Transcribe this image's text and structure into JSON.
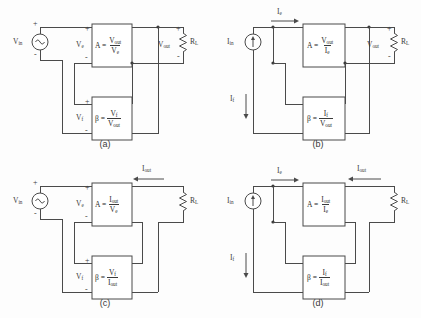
{
  "figure": {
    "background_color": "#fdfdfd",
    "line_color": "#4a4a4a"
  },
  "panels": [
    {
      "id": "a",
      "caption": "(a)",
      "topology": "series-shunt (voltage-series) voltage amplifier",
      "source": {
        "label": "V",
        "sub": "in",
        "type": "ac-voltage-source",
        "plus": "+",
        "minus": "-"
      },
      "error_signal": {
        "label": "V",
        "sub": "e",
        "plus": "+",
        "minus": "-"
      },
      "amplifier": {
        "symbol": "A",
        "equals": "=",
        "numerator": "V",
        "numerator_sub": "out",
        "denominator": "V",
        "denominator_sub": "e"
      },
      "feedback": {
        "symbol": "β",
        "equals": "=",
        "numerator": "V",
        "numerator_sub": "f",
        "denominator": "V",
        "denominator_sub": "out"
      },
      "feedback_signal": {
        "label": "V",
        "sub": "f",
        "plus": "+",
        "minus": "-"
      },
      "output": {
        "label": "V",
        "sub": "out",
        "plus": "+",
        "minus": "-"
      },
      "load": {
        "label": "R",
        "sub": "L"
      }
    },
    {
      "id": "b",
      "caption": "(b)",
      "topology": "shunt-shunt (transresistance) amplifier",
      "source": {
        "label": "I",
        "sub": "in",
        "type": "dc-current-source"
      },
      "error_signal": {
        "label": "I",
        "sub": "e",
        "arrow": "right"
      },
      "amplifier": {
        "symbol": "A",
        "equals": "=",
        "numerator": "V",
        "numerator_sub": "out",
        "denominator": "I",
        "denominator_sub": "e"
      },
      "feedback": {
        "symbol": "β",
        "equals": "=",
        "numerator": "I",
        "numerator_sub": "f",
        "denominator": "V",
        "denominator_sub": "out"
      },
      "feedback_signal": {
        "label": "I",
        "sub": "f",
        "arrow": "down"
      },
      "output": {
        "label": "V",
        "sub": "out",
        "plus": "+",
        "minus": "-"
      },
      "load": {
        "label": "R",
        "sub": "L"
      }
    },
    {
      "id": "c",
      "caption": "(c)",
      "topology": "series-series (transconductance) amplifier",
      "source": {
        "label": "V",
        "sub": "in",
        "type": "ac-voltage-source",
        "plus": "+",
        "minus": "-"
      },
      "error_signal": {
        "label": "V",
        "sub": "e",
        "plus": "+",
        "minus": "-"
      },
      "amplifier": {
        "symbol": "A",
        "equals": "=",
        "numerator": "I",
        "numerator_sub": "out",
        "denominator": "V",
        "denominator_sub": "e"
      },
      "feedback": {
        "symbol": "β",
        "equals": "=",
        "numerator": "V",
        "numerator_sub": "f",
        "denominator": "I",
        "denominator_sub": "out"
      },
      "feedback_signal": {
        "label": "V",
        "sub": "f",
        "plus": "+",
        "minus": "-"
      },
      "output": {
        "label": "I",
        "sub": "out",
        "arrow": "left"
      },
      "load": {
        "label": "R",
        "sub": "L"
      }
    },
    {
      "id": "d",
      "caption": "(d)",
      "topology": "shunt-series (current) amplifier",
      "source": {
        "label": "I",
        "sub": "in",
        "type": "dc-current-source"
      },
      "error_signal": {
        "label": "I",
        "sub": "e",
        "arrow": "right"
      },
      "amplifier": {
        "symbol": "A",
        "equals": "=",
        "numerator": "I",
        "numerator_sub": "out",
        "denominator": "I",
        "denominator_sub": "e"
      },
      "feedback": {
        "symbol": "β",
        "equals": "=",
        "numerator": "I",
        "numerator_sub": "f",
        "denominator": "I",
        "denominator_sub": "out"
      },
      "feedback_signal": {
        "label": "I",
        "sub": "f",
        "arrow": "down"
      },
      "output": {
        "label": "I",
        "sub": "out",
        "arrow": "left"
      },
      "load": {
        "label": "R",
        "sub": "L"
      }
    }
  ]
}
